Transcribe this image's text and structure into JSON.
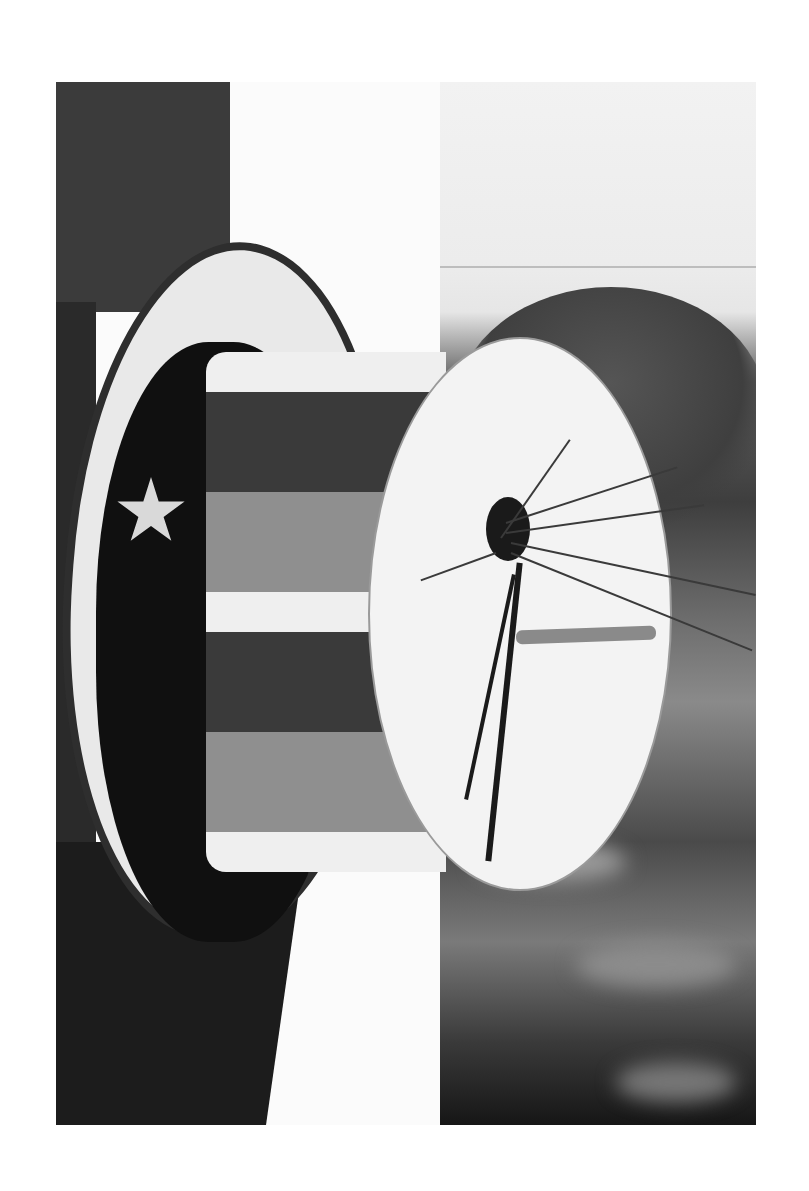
{
  "image": {
    "description": "Black-and-white photograph of a birdhouse shaped like an Uncle Sam style top hat with painted stripes and a star, mounted on a dark post, with a tuft of grass stuffed into the entrance hole and a wooden perch; blurred trees and lawn in background",
    "style": "monochrome photograph",
    "frame": {
      "left": 56,
      "top": 82,
      "width": 700,
      "height": 1043
    },
    "palette": {
      "page_bg": "#ffffff",
      "post": "#2a2a2a",
      "sky": "#f0f0f0",
      "brim": "#e9e9e9",
      "stripe_dark": "#3a3a3a",
      "stripe_mid": "#8f8f8f",
      "disc": "#f3f3f3"
    }
  },
  "elements": {
    "post": "dark wooden post",
    "hat_brim": "white painted brim with dark edge and mounting bracket",
    "hat_crown": "striped cylindrical crown",
    "star": "painted star on hat band",
    "end_disc": "white circular top of the hat",
    "entrance_hole": "round entrance hole with grass nesting material",
    "perch": "wooden dowel perch",
    "background": "blurred trees and lawn"
  }
}
